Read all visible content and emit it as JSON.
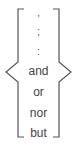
{
  "diagram": {
    "items": [
      {
        "text": ",",
        "kind": "punctuation"
      },
      {
        "text": ";",
        "kind": "punctuation"
      },
      {
        "text": ":",
        "kind": "punctuation"
      },
      {
        "text": "and",
        "kind": "conjunction"
      },
      {
        "text": "or",
        "kind": "conjunction"
      },
      {
        "text": "nor",
        "kind": "conjunction"
      },
      {
        "text": "but",
        "kind": "conjunction"
      }
    ],
    "bracket_color": "#555555",
    "text_color": "#444444"
  }
}
